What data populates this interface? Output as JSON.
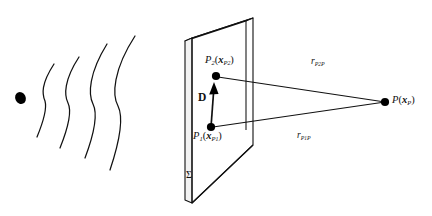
{
  "figure": {
    "name": "wavefront-aperture-diagram",
    "background_color": "#ffffff",
    "stroke_color": "#111111",
    "width": 432,
    "height": 216
  },
  "source": {
    "name": "point-source-blob",
    "cx": 20.5,
    "cy": 98,
    "rx": 5.2,
    "ry": 6.2,
    "rotation": -25,
    "fill": "#000000"
  },
  "wavefronts": {
    "count": 4,
    "label": "spherical-wavefront-arcs",
    "paths": [
      "M 54 64 C 41 84 42 94 45 101 C 47 108 44 120 37 137",
      "M 79 57 C 64 80 64 95 68 103 C 72 111 68 128 60 148",
      "M 107 44 C 89 73 88 94 93 104 C 98 114 94 134 85 158",
      "M 135 36 C 113 70 112 95 118 106 C 124 118 120 140 110 170"
    ]
  },
  "aperture_plane": {
    "name": "aperture-plane-sigma",
    "label": "Σ",
    "front_face": "M 192 38 L 253 18 L 253 145 L 192 203 Z",
    "side_face": "M 185 41 L 192 38 L 192 203 L 185 200 Z",
    "top_face": "M 185 41 L 246 21 L 253 18 L 192 38 Z",
    "face_fill": "#ffffff",
    "edge_fill": "#f2f2f2"
  },
  "points": [
    {
      "id": "P2",
      "name": "secondary-source-point-p2",
      "x": 216,
      "y": 76,
      "r": 4.1,
      "label_main": "P",
      "label_sub": "2",
      "label_vec": "x",
      "label_vec_sub": "P",
      "label_vec_sub2": "2"
    },
    {
      "id": "P1",
      "name": "secondary-source-point-p1",
      "x": 211,
      "y": 127,
      "r": 4.1,
      "label_main": "P",
      "label_sub": "1",
      "label_vec": "x",
      "label_vec_sub": "P",
      "label_vec_sub2": "1"
    },
    {
      "id": "P",
      "name": "observation-point-p",
      "x": 385,
      "y": 102,
      "r": 4.1,
      "label_main": "P",
      "label_sub": "",
      "label_vec": "x",
      "label_vec_sub": "P",
      "label_vec_sub2": ""
    }
  ],
  "vectors": {
    "d": {
      "name": "displacement-vector-d",
      "label": "D",
      "from_x": 211,
      "from_y": 127,
      "to_x": 214,
      "to_y": 84,
      "line": "M 211 127 L 213.6 92",
      "arrowhead": "M 214 82 L 209.2 94.4 L 218.6 94.0 Z"
    }
  },
  "rays": [
    {
      "id": "r_P2P",
      "name": "ray-p2-to-p",
      "line": "M 218 77 L 385 102",
      "label_main": "r",
      "label_sub": "P",
      "label_sub2": "2",
      "label_tail": "P"
    },
    {
      "id": "r_P1P",
      "name": "ray-p1-to-p",
      "line": "M 213 127 L 385 102",
      "label_main": "r",
      "label_sub": "P",
      "label_sub2": "1",
      "label_tail": "P"
    }
  ],
  "plane_interior_lines": {
    "name": "plane-perspective-edges",
    "paths": [
      "M 246 21 L 246 130",
      "M 192 203 L 253 145"
    ]
  }
}
